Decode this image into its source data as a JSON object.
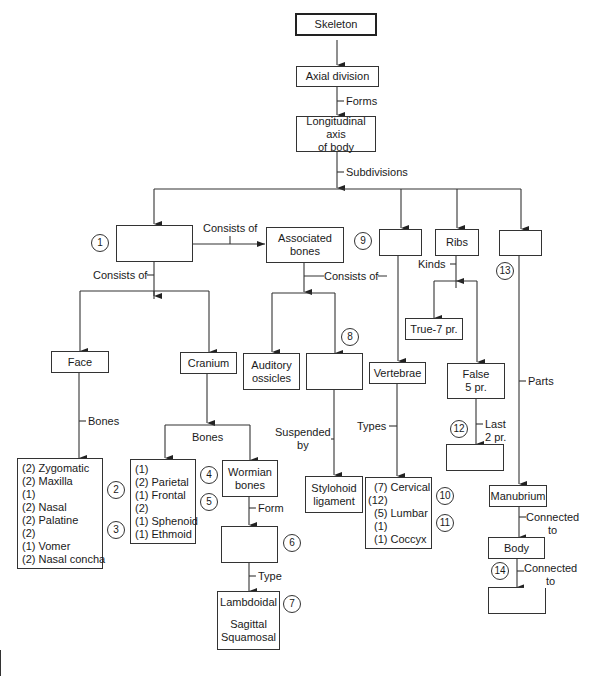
{
  "diagram": {
    "title": "Skeleton",
    "nodes": {
      "skeleton": "Skeleton",
      "axial": "Axial division",
      "longitudinal": [
        "Longitudinal axis",
        "of body"
      ],
      "blank1": "",
      "associated": [
        "Associated",
        "bones"
      ],
      "blank9": "",
      "ribs": "Ribs",
      "blank13": "",
      "face": "Face",
      "cranium": "Cranium",
      "auditory": [
        "Auditory",
        "ossicles"
      ],
      "blank8": "",
      "true_ribs": "True-7 pr.",
      "vertebrae": "Vertebrae",
      "false_ribs": [
        "False",
        "5 pr."
      ],
      "blank12": "",
      "face_bones": [
        "(2) Zygomatic",
        "(2) Maxilla",
        "(1)",
        "(2) Nasal",
        "(2) Palatine",
        "(2)",
        "(1) Vomer",
        "(2) Nasal concha"
      ],
      "cranium_bones": [
        "(1)",
        "(2) Parietal",
        "(1) Frontal",
        "(2)",
        "(1) Sphenoid",
        "(1) Ethmoid"
      ],
      "wormian": [
        "Wormian",
        "bones"
      ],
      "blank6": "",
      "sutures": [
        "Lambdoidal",
        "",
        "Sagittal",
        "Squamosal"
      ],
      "stylohoid": [
        "Stylohoid",
        "ligament"
      ],
      "vertebra_types": [
        "(7) Cervical",
        "(12)",
        "(5) Lumbar",
        "(1)",
        "(1) Coccyx"
      ],
      "manubrium": "Manubrium",
      "body": "Body",
      "blank14": ""
    },
    "edge_labels": {
      "forms": "Forms",
      "subdivisions": "Subdivisions",
      "consists_of_right": "Consists of",
      "consists_of_down": "Consists of",
      "consists_of_assoc": "Consists of",
      "kinds": "Kinds",
      "bones_face": "Bones",
      "bones_cranium": "Bones",
      "suspended_by": [
        "Suspended",
        "by"
      ],
      "types": "Types",
      "parts": "Parts",
      "last": [
        "Last",
        "2 pr."
      ],
      "form": "Form",
      "type": "Type",
      "connected_to_1": [
        "Connected",
        "to"
      ],
      "connected_to_2": [
        "Connected",
        "to"
      ]
    },
    "markers": [
      "1",
      "2",
      "3",
      "4",
      "5",
      "6",
      "7",
      "8",
      "9",
      "10",
      "11",
      "12",
      "13",
      "14"
    ]
  }
}
